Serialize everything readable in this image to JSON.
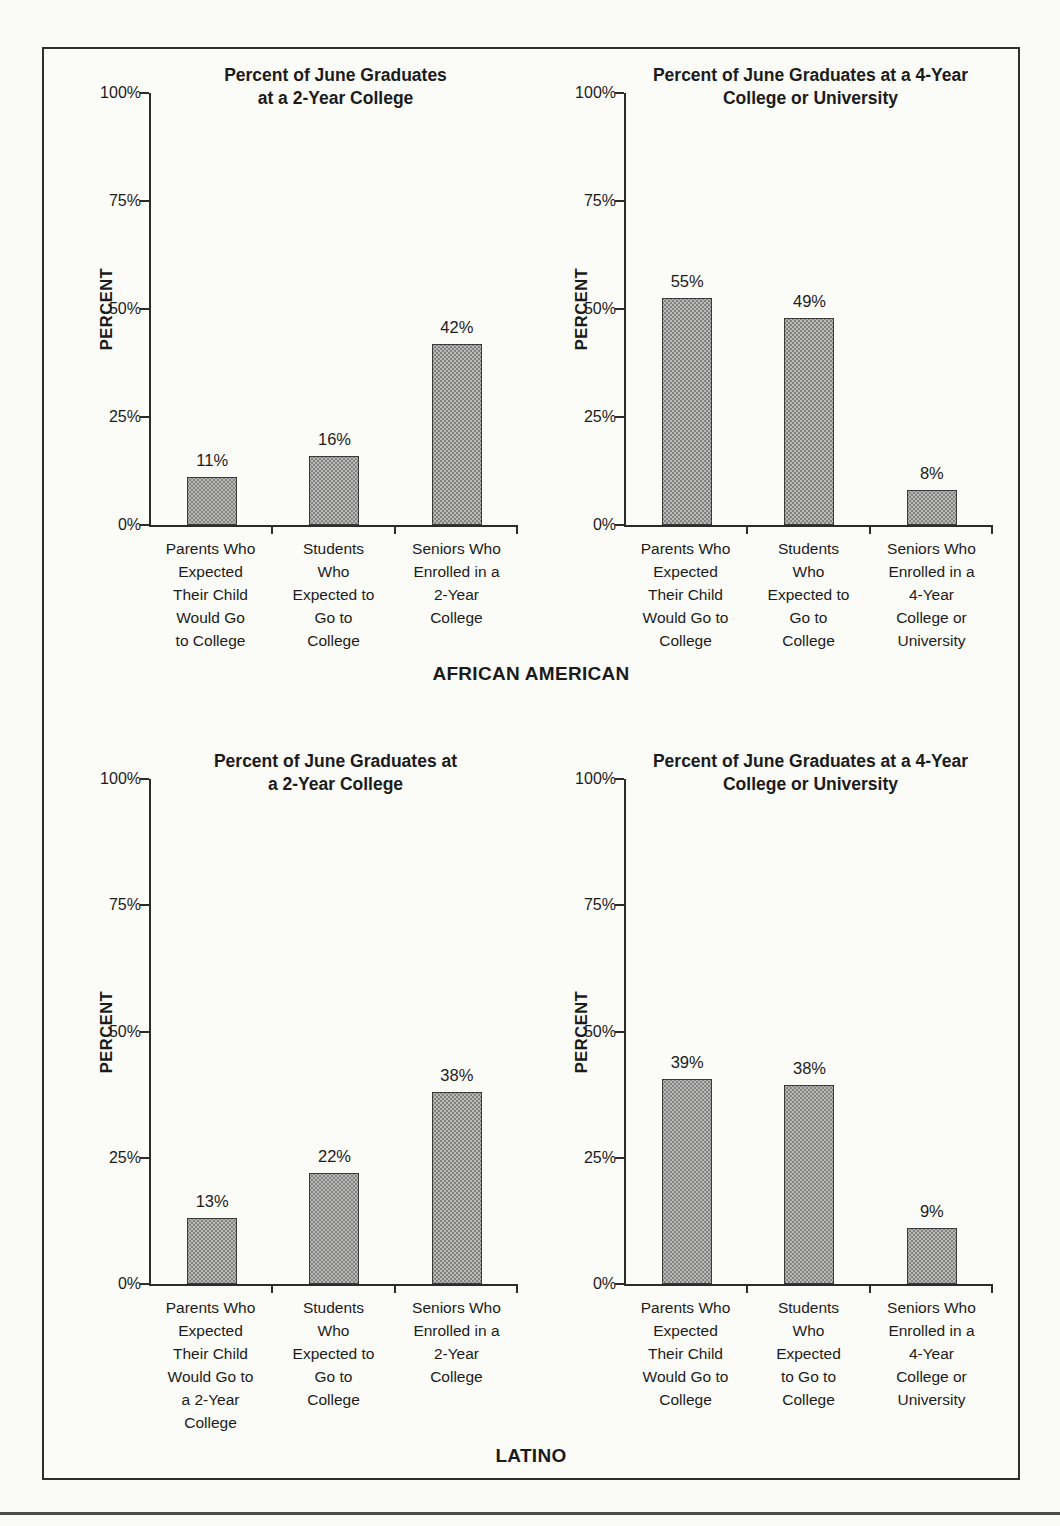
{
  "figure": {
    "background": "#fbfbf8",
    "border_color": "#2e2e2e",
    "text_color": "#1b1b1b",
    "bar_fill_color": "#b9b9b7",
    "bar_border_color": "#3a3a3a",
    "groups": [
      {
        "label": "AFRICAN AMERICAN"
      },
      {
        "label": "LATINO"
      }
    ]
  },
  "chart_data": [
    {
      "type": "bar",
      "group": "AFRICAN AMERICAN",
      "title": "Percent of June Graduates at a 2-Year College",
      "title_lines": [
        "Percent of June Graduates",
        "at a 2-Year College"
      ],
      "xlabel": "",
      "ylabel": "PERCENT",
      "ylim": [
        0,
        100
      ],
      "yticks": [
        0,
        25,
        50,
        75,
        100
      ],
      "ytick_labels": [
        "0%",
        "25%",
        "50%",
        "75%",
        "100%"
      ],
      "grid": false,
      "categories": [
        "Parents Who Expected Their Child Would Go to College",
        "Students Who Expected to Go to College",
        "Seniors Who Enrolled in a 2-Year College"
      ],
      "category_lines": [
        [
          "Parents Who",
          "Expected",
          "Their Child",
          "Would Go",
          "to College"
        ],
        [
          "Students",
          "Who",
          "Expected to",
          "Go to",
          "College"
        ],
        [
          "Seniors Who",
          "Enrolled in a",
          "2-Year",
          "College"
        ]
      ],
      "values": [
        11,
        16,
        42
      ],
      "value_labels": [
        "11%",
        "16%",
        "42%"
      ],
      "drawn_values": [
        11,
        16,
        42
      ]
    },
    {
      "type": "bar",
      "group": "AFRICAN AMERICAN",
      "title": "Percent of June Graduates at a 4-Year College or University",
      "title_lines": [
        "Percent of June Graduates at a 4-Year",
        "College or University"
      ],
      "xlabel": "",
      "ylabel": "PERCENT",
      "ylim": [
        0,
        100
      ],
      "yticks": [
        0,
        25,
        50,
        75,
        100
      ],
      "ytick_labels": [
        "0%",
        "25%",
        "50%",
        "75%",
        "100%"
      ],
      "grid": false,
      "categories": [
        "Parents Who Expected Their Child Would Go to College",
        "Students Who Expected to Go to College",
        "Seniors Who Enrolled in a 4-Year College or University"
      ],
      "category_lines": [
        [
          "Parents Who",
          "Expected",
          "Their Child",
          "Would Go to",
          "College"
        ],
        [
          "Students",
          "Who",
          "Expected to",
          "Go to",
          "College"
        ],
        [
          "Seniors Who",
          "Enrolled in a",
          "4-Year",
          "College or",
          "University"
        ]
      ],
      "values": [
        55,
        49,
        8
      ],
      "value_labels": [
        "55%",
        "49%",
        "8%"
      ],
      "drawn_values": [
        52.5,
        48,
        8
      ]
    },
    {
      "type": "bar",
      "group": "LATINO",
      "title": "Percent of June Graduates at a 2-Year College",
      "title_lines": [
        "Percent of June Graduates at",
        "a 2-Year College"
      ],
      "xlabel": "",
      "ylabel": "PERCENT",
      "ylim": [
        0,
        100
      ],
      "yticks": [
        0,
        25,
        50,
        75,
        100
      ],
      "ytick_labels": [
        "0%",
        "25%",
        "50%",
        "75%",
        "100%"
      ],
      "grid": false,
      "categories": [
        "Parents Who Expected Their Child Would Go to a 2-Year College",
        "Students Who Expected to Go to College",
        "Seniors Who Enrolled in a 2-Year College"
      ],
      "category_lines": [
        [
          "Parents Who",
          "Expected",
          "Their Child",
          "Would Go to",
          "a 2-Year",
          "College"
        ],
        [
          "Students",
          "Who",
          "Expected to",
          "Go to",
          "College"
        ],
        [
          "Seniors Who",
          "Enrolled in a",
          "2-Year",
          "College"
        ]
      ],
      "values": [
        13,
        22,
        38
      ],
      "value_labels": [
        "13%",
        "22%",
        "38%"
      ],
      "drawn_values": [
        13,
        22,
        38
      ]
    },
    {
      "type": "bar",
      "group": "LATINO",
      "title": "Percent of June Graduates at a 4-Year College or University",
      "title_lines": [
        "Percent of June Graduates at a 4-Year",
        "College or University"
      ],
      "xlabel": "",
      "ylabel": "PERCENT",
      "ylim": [
        0,
        100
      ],
      "yticks": [
        0,
        25,
        50,
        75,
        100
      ],
      "ytick_labels": [
        "0%",
        "25%",
        "50%",
        "75%",
        "100%"
      ],
      "grid": false,
      "categories": [
        "Parents Who Expected Their Child Would Go to College",
        "Students Who Expected to Go to College",
        "Seniors Who Enrolled in a 4-Year College or University"
      ],
      "category_lines": [
        [
          "Parents Who",
          "Expected",
          "Their Child",
          "Would Go to",
          "College"
        ],
        [
          "Students",
          "Who",
          "Expected",
          "to Go to",
          "College"
        ],
        [
          "Seniors Who",
          "Enrolled in a",
          "4-Year",
          "College or",
          "University"
        ]
      ],
      "values": [
        39,
        38,
        9
      ],
      "value_labels": [
        "39%",
        "38%",
        "9%"
      ],
      "drawn_values": [
        40.5,
        39.5,
        11
      ]
    }
  ]
}
